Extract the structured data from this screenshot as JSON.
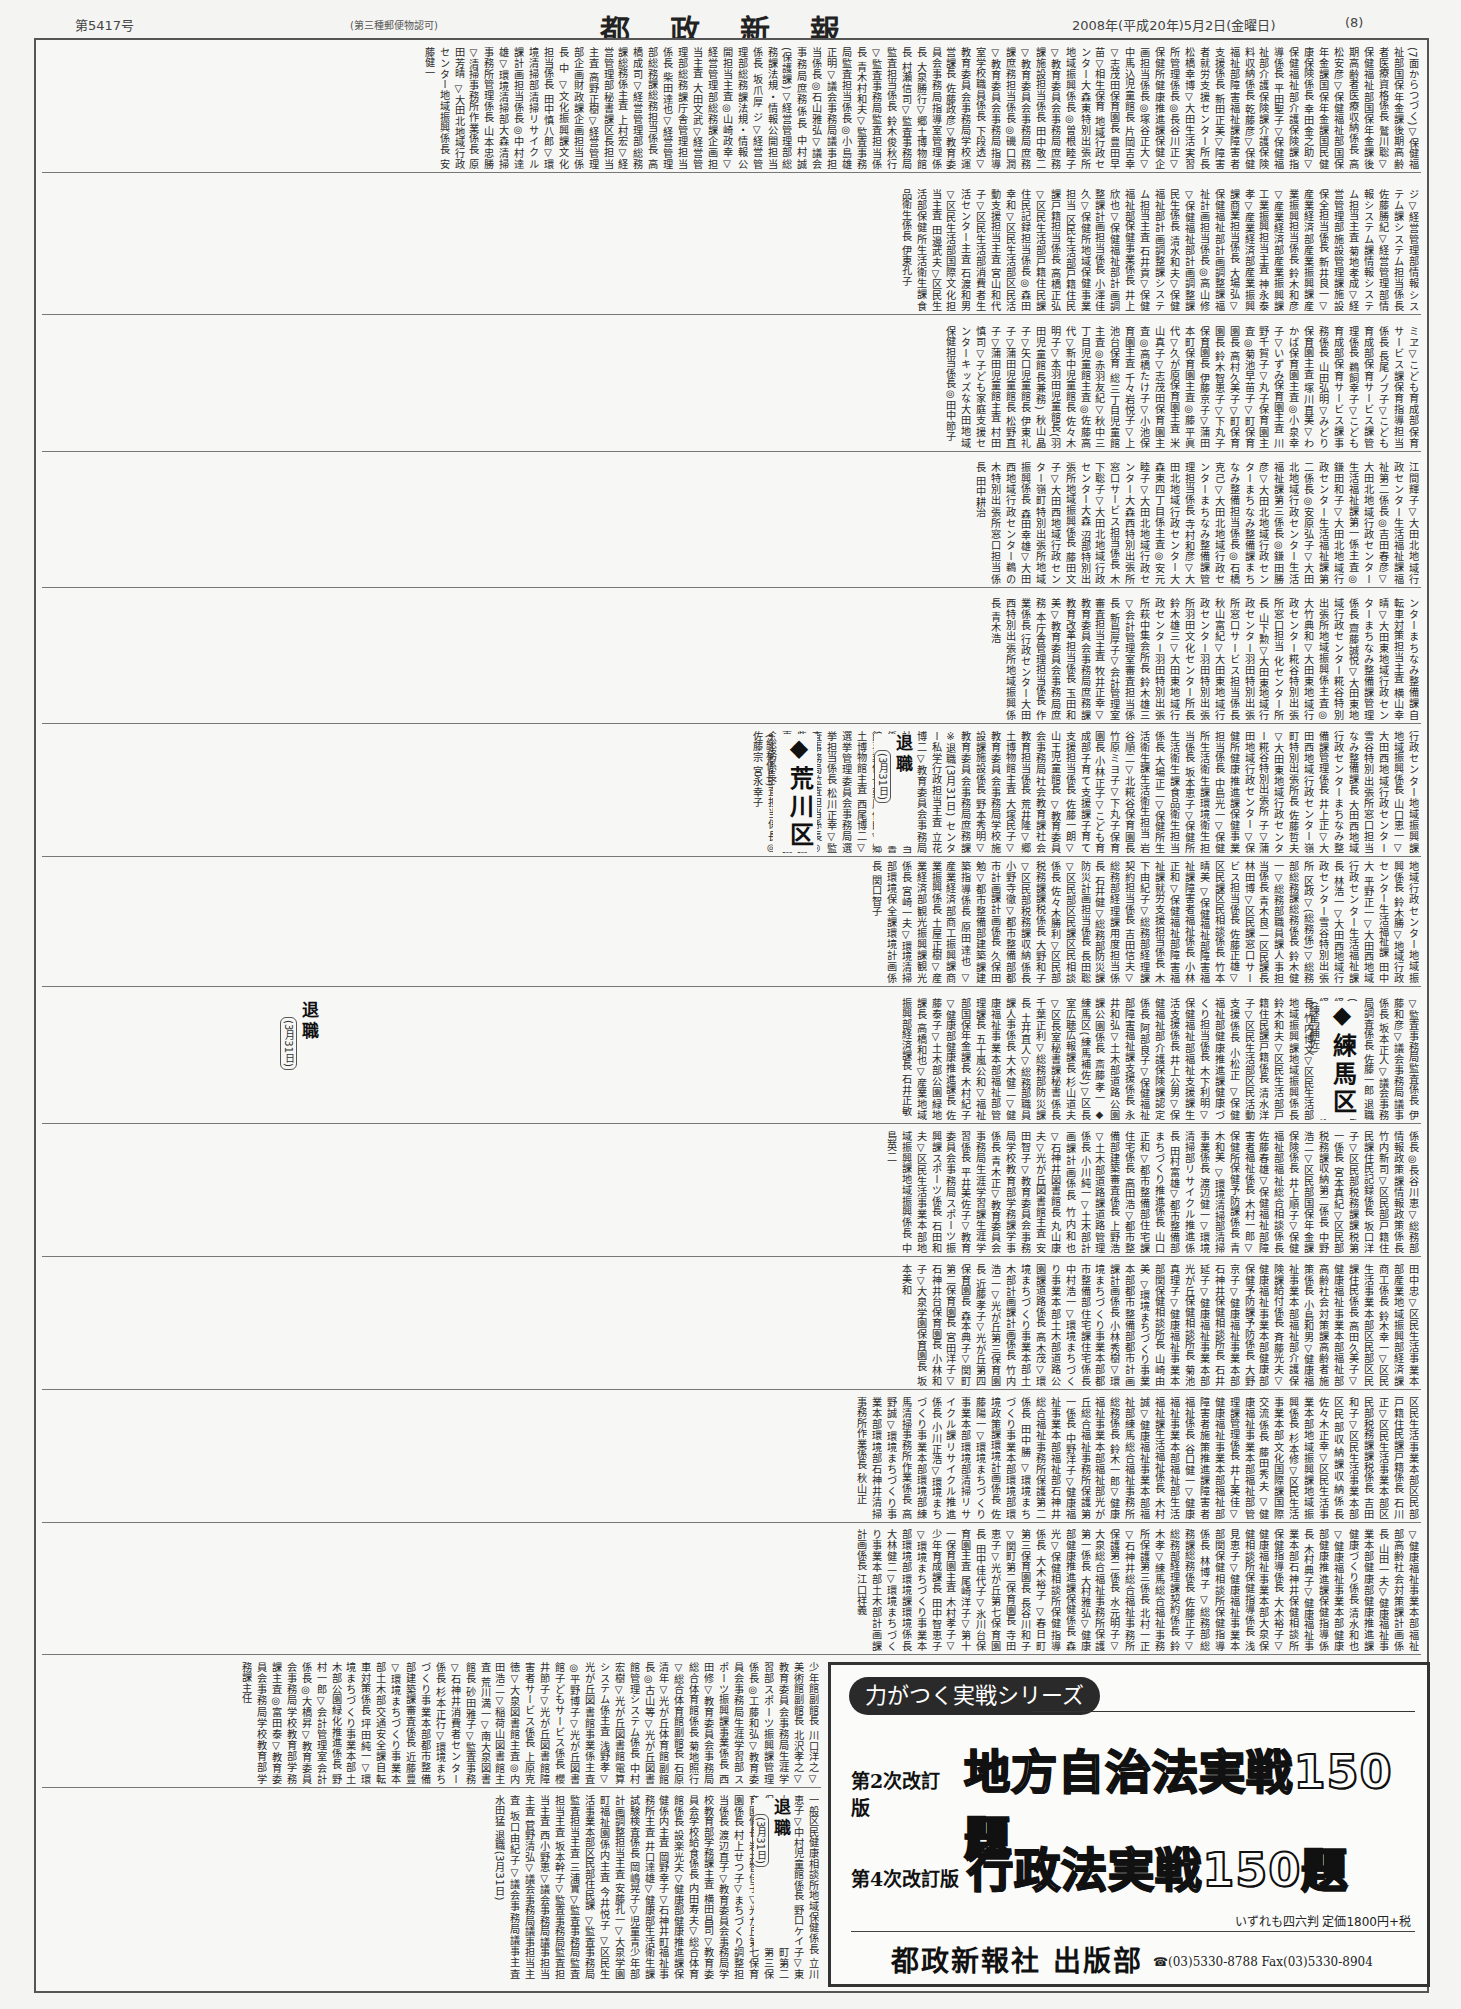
{
  "masthead": {
    "issue_number": "第5417号",
    "postal_permit": "(第三種郵便物認可)",
    "title": "都政新報",
    "date": "2008年(平成20年)5月2日(金曜日)",
    "page_number": "(8)"
  },
  "tiers": [
    {
      "text": "(7面からつづく)▽保健福祉部国保年金課後期高齢者医療資格係長 鷲川聡▽保健福祉部国保年金課後期高齢者医療収納係長 高松安彦▽保健福祉部国保年金課国保年金課国民健康保険係長 幸田金之助▽保健福祉部介護保険課指導係長 平田聖子▽保健福祉部介護保険課介護保険料収納係長 乾藤彦▽保健福祉部障害福祉課障害者支援係長 新田正美▽障害者就労支援センター所長 松橋幸博▽大田生活実習所管理係長◎長谷川正▽保健所健康推進課保健企画担当係長◎塚谷正大▽中馬込児童館長 片岡吉幸▽志茂田保育園長 豊田早苗▽相生保育 地域行政センター大森東特別出張所地域振興係長◎曽根睦子▽教育委員会事務局庶務課施設担当係長 田中敬二▽教育委員会事務局庶務課庶務担当係長◎磯口潤▽教育委員会事務局指導室学校職員係長 下段透▽教育委員会事務局学校運営課長 佐藤政彦▽教育委員会事務局指導室管理係長 大泉勝行▽郷土博物館長 村瀬信司▽監査事務局監査担当係長 鈴木俊秋行▽監査事務局監査担当係長 青木村和夫▽監査事務局監査担当係長◎小島雄正明▽議会事務局議事担当係長◎石山雅弘▽議会事務局庶務係長 中村誠(保護課)▽経営管理部総務課法規・情報公開担当係長 坂爪厚 ジ▽経営管理部総務課法規・情報公開担当主査◎山崎政幸▽経営管理部総務課企画担当主査 大田文武▽経営管理部総務課庁舎管理担当係長 柴田達也▽経営管理部総務課総務担当係長 高橋成司▽経営管理部総務課総務係主査 上村宏▽経営管理部秘書課区長担当主査 高野正樹▽経営管理部企画財政課企画担当係長 中 ▽文化振興課文化担当係長 田中慎八郎▽環境清掃部清掃リサイクル課計画担当係長◎中村達雄▽環境清掃部大森清掃事務所管理係長 山本忠勝▽清掃事務所作業係長 原田芳晴 ▽大田北地域行政センター地域振興係長 安藤健一"
    },
    {
      "text": "ジ▽経営管理部情報システム課システム担当係長 佐藤勝紀▽経営管理部情報システム課情報システム担当主査 菊地孝成▽経営管理部施設管理課施設保全担当係長 新井良一▽産業経済部産業振興課産業振興担当係長 鈴木和彦▽産業経済部産業振興課工業振興担当主査 神永泰孝▽産業経済部産業振興課商業担当係長 大場弘▽保健福祉部計画調整課福祉計画担当係長◎高山修▽保健福祉部計画調整課民生係長 清水和夫▽保健福祉部計画調整課システム担当主査 石井貢▽保健福祉部保健事業係長 井上欣也▽保健福祉部計画調整課計画担当係長 小澤佳久▽保健所地域保健事業担当 区民生活部戸籍住民課戸籍担当係長 高橋正弘▽区民生活部戸籍住民課住民記録担当係長◎森田幸和▽区民生活部区民活動支援担当主査 宮山和代子▽区民生活部消費者生活センター主査 石渡和男▽区民生活部国際文化担当主査 田邊武夫▽区民生活部保健所生活衛生課食品衛生係長 伊東孔子"
    },
    {
      "text": "ミヱ▽こども育成部保育サービス課保育指導担当係長 長尾ノブ子▽こども育成部保育サービス課管理係長 鵜飼幸子▽こども育成部保育サービス課事務係長 山田弘明▽みどり保育園主査 塚川直美▽わかば保育園主査◎小泉幸子▽いずみ保育園主査 川野千賀子▽丸子保育園主査◎菊池早苗子▽町保育園長 高村久美子▽町保育園長 鈴木智恵子▽下丸子保育園長 伊藤京子▽蒲田本町保育園主査◎藤平眞代▽久が原保育園主査 米山真子▽志茂田保育園主査◎高橋たけ子▽小池保育園主査 千々岩悦子▽上池台保育 総三丁目児童館主査◎赤羽友紀▽秋中三丁目児童館主査◎佐藤高代▽新中児童館長 佐々木明子▽本羽田児童館長(羽田児童館長兼務) 秋山晶子▽矢口児童館長 伊東礼子▽蒲田児童館長 松野直子▽蒲田児童館主査 村田慎司▽子ども家庭支援センターキッズな大田地域保健担当係長◎田中節子"
    },
    {
      "text": "江間輝子▽大田北地域行政センター生活福祉課福祉第二係長◎吉田春彦▽大田北地域行政センター生活福祉課第一係主査◎鎌田和子▽大田北地域行政センター生活福祉課第二係長◎安原弘子▽大田北地域行政センター生活福祉課第三係長◎鎌田勝彦▽大田北地域行政センターまちなみ整備課まちなみ整備担当係長◎石橋克己▽大田北地域行政センターまちなみ整備課管理担当係長 寺村和彦▽大田北地域行政センター大森東四丁目係主査◎安元睦子▽大田北地域行政センター大森西特別出張所窓口サービス担当係長 木下聡子▽大田北地域行政センター大森 沼部特別出張所地域振興係長 藤田文子▽大田西地域行政センター嶺町特別出張所地域振興係長 森田幸雄▽大田西地域行政センター鵜の木特別出張所窓口担当係長 田中耕治"
    },
    {
      "text": "ンターまちなみ整備課自転車対策担当主査 横山幸晴▽大田東地域行政センターまちなみ整備課管理係長 齋藤誠悦▽大田東地域行政センター糀谷特別出張所地域振興係主査◎大竹典和▽大田東地域行政センター糀谷特別出張所窓口担当 化センター所長 山下勲▽大田東地域行政センター羽田特別出張所窓口サービス担当係長 秋山富紀▽大田東地域行政センター羽田特別出張所羽田文化センター所長 鈴木雄三▽大田東地域行政センター羽田特別出張所萩中集会所長 鈴木雄三▽会計管理室審査担当係長 新島厚子▽会計管理室審査担当主査 牧井正幸▽教育委員会事務局庶務課教育改革担当係長 玉田和美▽教育委員会事務局庶務 本庁舎管理担当係長 作業係長 行政センター大田西特別出張所地域振興係長 青木浩"
    },
    {
      "text": "行政センター地域振興課地域振興係長 山口恵一▽大田西地域行政センター雪谷特別出張所窓口担当 なみ整備課長 大田西地域行政センターまちなみ整備課管理係長 井上正▽大田西地域行政センター嶺町特別出張所長 佐藤哲夫▽大田東地域行政センター糀谷特別出張所 子▽蒲田地域行政センター▽保健所健康推進課保健事業担当係長 中島光一▽保健所生活衛生課環境衛生担当係長 坂本恵子▽保健所生活衛生課食品衛生担当係長 大場正二▽保健所生活衛生課生活衛生担当 岩谷順二▽北糀谷保育園長 竹原ミヨ子▽下丸子保育園長 小林正子▽こども育成部子育て支援課子育て支援担当係長 佐藤一朗▽山王児童館長 ▽教育委員会事務局社会教育課社会教育担当係長 荒井隆▽郷土博物館主査 大塚民子▽教育委員会事務局学校施設課施設係長 野本秀明▽教育委員会事務局庶務課 ※退職(3月31日) センター私学行政担当主査 立花博二▽教育委員会事務局社会教育課社会教育担当係長 松本紗织▽大田図書館事業係長 栗原保郎▽郷土博物館主査 西尾博二▽選挙管理委員会事務局選挙担当係長 松川正幸▽監査事務局監査担当係長◎柴山弘子▽議会事務局議事担当係長 山中秀二▽議会事務局調査担当係長◎佐藤宗 宮永幸子"
    },
    {
      "text": "地域行政センター地域振興係長 鈴木勝▽地域行政センター生活福祉課 田中大 平野正一▽大田西地域行政センター生活福祉課長 林浩一▽大田西地域行政センター雪谷特別出張所 区政▽(総務係)▽総務部総務課総務係長 鈴木健一▽総務部職員課人事担当係長 青木良二 区民課長 林田博▽区民課窓口サービス担当係長 佐藤正雄▽区民課区民相談係長 竹本晴美 ▽保健福祉部障害福祉課障害者福祉係長 小林正和▽保健福祉部障害福祉課就労支援担当係長 木下由紀子▽総務部経理課契約担当係長 吉田信夫▽総務部経理課用度担当係長 石井健▽総務部防災課防災計画担当係長 長田聡 ▽区民部区民課区民相談係長 佐々木勝利▽区民部税務課課税係長 大野和子▽区民部税務課収納係長 小野寺徹▽都市整備部都市計画課計画係長 久保田勉▽都市整備部建築課建築指導係長 原田達也 ▽産業経済部商工振興課商業振興係長 土屋正樹▽産業経済部観光振興課観光係長 宮崎一夫▽環境清掃部環境保全課環境計画係長 関口智子"
    },
    {
      "text": "▽監査事務局監査係長 伊藤和彦▽議会事務局議事係長 坂本正人▽議会事務局調査係長 佐藤一郎 退職(3月31日) ▽経営管理部経理課契約係長 中村勇▽経営管理部経理課用度係長 竹内博文▽区民生活部地域振興課地域振興係長 鈴木和夫▽区民生活部戸籍住民課戸籍係長 清水洋子▽区民生活部区民活動支援係長 小松正 ▽保健福祉部健康推進課健康づくり担当係長 木下利明▽保健福祉部福祉支援課生活支援係長 井上公男▽保健福祉部介護保険課認定係長 阿部良子▽保健福祉部障害福祉課支援係長 永井和弘▽土木部道路公園課公園係長 斎藤孝一 ◆練馬区(練馬補佐)▽区長室広聴広報課長 杉山道夫▽区長室秘書課秘書係長 千葉正利▽総務部防災課長 土井直人▽総務部職員課人事係長 大木健二▽健康福祉事業本部福祉部管理課長 五十嵐公和▽福祉部国保年金課長 木村紀子▽健康部健康推進課長 佐藤泰子▽土木部公園緑地課長 高橋和也▽産業地域振興部経済課長 石井正敏"
    },
    {
      "text": "係長◎長谷川恵▽総務部情報政策課情報政策係長 竹内新司▽区民部戸籍住民課住民記録係長 坂口洋子▽区民部税務課課税第一係長 宮本真紀▽区民部税務課収納第二係長 中野浩二▽区民部国保年金課保険係長 井上順子▽保健福祉部福祉総合相談係長 佐藤春雄▽保健福祉部障害者福祉係長 木村一郎▽保健所保健予防課係長 青木和美 ▽環境清掃部清掃事業係長 渡辺健一▽環境清掃部リサイクル推進係長 田村富雄▽都市整備部まちづくり推進係長 山口正和▽都市整備部住宅課住宅係長 高田浩▽都市整備部建築審査係長 上野浩▽土木部道路課道路管理係長 小川純一▽土木部計画課計画係長 竹内和也 ▽石神井図書館長 丸山康夫▽光が丘図書館主査 安田智子▽教育委員会事務局学校教育部学務課学事係長 青木正▽教育委員会事務局生涯学習課生涯学習係長 平井美佐子▽教育委員会事務局スポーツ振興課スポーツ係長 石田和夫▽区民生活事業本部地域振興課地域振興係長 中島英二"
    },
    {
      "text": "田中忠▽区民生活事業本部産業地域振興部経済課商工係長 鈴木幸一▽区民生活事業本部区民部区民課住民係長 高田久美子▽健康福祉事業本部福祉部高齢社会対策課高齢者施策係長 小島和男▽健康福祉事業本部福祉部介護保険課給付係長 斉藤光夫▽健康福祉事業本部健康部保健予防課予防係長 大野京子▽健康福祉事業本部石神井保健相談所長 石井延子▽健康福祉事業本部光が丘保健相談所長 菊池真理子▽健康福祉事業本部関保健相談所長 山崎由美 ▽環境まちづくり事業本部都市整備部都市計画課計画係長 小林秀樹▽環境まちづくり事業本部都市整備部住宅課住宅係長 中村浩一▽環境まちづくり事業本部土木部道路公園課道路係長 高木茂▽環境まちづくり事業本部土木部計画課計画係長 竹内浩二 ▽光が丘第三保育園長 近藤孝子▽光が丘第四保育園長 森本典子▽関町第二保育園長 宮田洋子▽石神井台保育園長 小林和子▽大泉学園保育園長 坂本美和"
    },
    {
      "text": "区民生活事業本部区民部戸籍住民課戸籍係長 石川正▽区民生活事業本部区民部税務課課税係長 吉田和子▽区民生活事業本部区民部収納課収納係長 佐々木正幸▽区民生活事業本部地域振興課地域振興係長 杉本修▽区民生活事業本部文化国際課国際交流係長 藤田秀夫 ▽健康福祉事業本部福祉部管理課管理係長 井上美佳▽健康福祉事業本部福祉部障害者施策推進課障害者福祉係長 谷口健一▽健康福祉事業本部福祉部生活福祉課生活福祉係長 木村誠▽健康福祉事業本部福祉部練馬総合福祉事務所総務係長 鈴木一郎▽健康福祉事業本部福祉部光が丘総合福祉事務所保護第一係長 中野洋子▽健康福祉事業本部福祉部石神井総合福祉事務所保護第二係長 田中勝 ▽環境まちづくり事業本部環境部環境政策課環境計画係長 佐藤陽一▽環境まちづくり事業本部環境部清掃リサイクル課リサイクル推進係長 小川正浩▽環境まちづくり事業本部環境部練馬清掃事務所作業係長 高野誠▽環境まちづくり事業本部環境部石神井清掃事務所作業係長 秋山正"
    },
    {
      "text": "▽健康福祉事業本部福祉部高齢社会対策課計画係長 山田一夫▽健康福祉事業本部健康部健康推進課健康づくり係長 清水和也▽健康福祉事業本部健康部健康推進課保健指導係長 木村典子▽健康福祉事業本部石神井保健相談所保健指導係長 大木裕子▽健康福祉事業本部大泉保健相談所保健指導係長 浅見恵子▽健康福祉事業本部関保健相談所保健指導係長 林博子 ▽総務部総務課総務係長 佐藤正子▽総務部経理課契約係長 鈴木孝▽練馬総合福祉事務所保護第三係長 北村一正▽石神井総合福祉事務所保護第二係長 水元明子▽大泉総合福祉事務所保護第一係長 大村雅弘▽健康部健康推進課保健係長 森光▽保健相談所保健指導係長 大木裕子 ▽春日町第三保育園長 長谷川和子▽関町第二保育園長 寺田恵子▽光が丘第七保育園長 田中佳代子▽氷川台保育園主査 尾崎洋子▽第十一保育園主査 木村孝子▽少年育成課長 田中智恵子▽環境まちづくり事業本部環境部環境課環境係長 大林健二▽環境まちづくり事業本部土木部計画課計画係長 江口祥義"
    },
    {
      "text": "少年館副館長 川口洋之▽美術館副館長 北沢孝之▽教育委員会事務局生涯学習部スポーツ振興課管理係長◎工藤和弘▽教育委員会事務局生涯学習部スポーツ振興課事業係長 西田修▽教育委員会事務局総合体育館係長 菊地照行▽総合体育館副館長 石原清年▽光が丘体育館副館長◎古山等▽光が丘図書館管理システム係長 中村宏樹▽光が丘図書館電算システム係主査 浅野孝▽光が丘図書館事業係主査◎平野博子▽光が丘図書館子どもサービス係長 櫻井節子▽光が丘図書館障害者サービス係長 上原克徳▽大泉図書館主査◎内田浩二▽稲荷山図書館主査 荒川満一▽南大泉図書館長 砂田雅子▽監査事務 ▽石神井消費者センター係長 杉本正行▽環境まちづくり事業本部都市整備部建築課審査係長 近藤豊▽環境まちづくり事業本部土木部交通安全課自転車対策係長 坪田純一▽環境まちづくり事業本部土木部公園緑化推進係長 野村一郎▽会計管理室会計係長◎大橋昇▽教育委員会事務局学校教育部学務課主査◎富田泰▽教育委員会事務局学校教育部学務課主任"
    },
    {
      "text": "一般区民健康相談所地域保健係長 立川恵子▽中村児童館係長 野口ケイ子▽東大泉保育園係長 庄司栄子▽春日町第二保育園係長 紀野キチ▽上石神井第三保育園係長 岩井智佳子▽光が丘第七保育園係長 村上せつ子▽まちづくり調整担当係長 渡辺直子▽教育委員会事務局学校教育部学務課主査 横田昌司▽教育委員会学校給食係長 内田寿夫▽総合体育館係長 設楽光夫▽健康部健康推進課保健係内主査 岡野幸子▽石神井町福祉事務所主査 井口達雄▽健康部生活衛生課試験検査係長 岡嶋晃子▽児童青少年部計画調整担当主査 安藤孔一▽大泉学園町福祉園係内主査 今井悦子 ▽区民生活事業本部区民部住民課 ▽監査事務局監査担当主査 三浦實▽監査事務局監査担当主査 坂本幹子▽監査事務局監査担当主査 西小野恵▽議会事務局議事担当主査 菅野清弘▽議会事務局議事担当主査 坂口由紀子▽議会事務局議事主査 水田猛 退職(3月31日)"
    }
  ],
  "headings": {
    "arakawa": {
      "label": "◆荒川区",
      "sub": "(総務係長)"
    },
    "nerima": {
      "label": "◆練馬区",
      "sub": "(練馬補佐)"
    },
    "retire_label": "退職",
    "retire_date": "(3月31日)"
  },
  "advertisement": {
    "series": "力がつく実戦シリーズ",
    "books": [
      {
        "edition": "第2次改訂版",
        "title": "地方自治法実戦150題"
      },
      {
        "edition": "第4次改訂版",
        "title": "行政法実戦150題"
      }
    ],
    "price_note": "いずれも四六判 定価1800円+税",
    "publisher": "都政新報社 出版部",
    "contact": "☎(03)5330-8788 Fax(03)5330-8904"
  }
}
